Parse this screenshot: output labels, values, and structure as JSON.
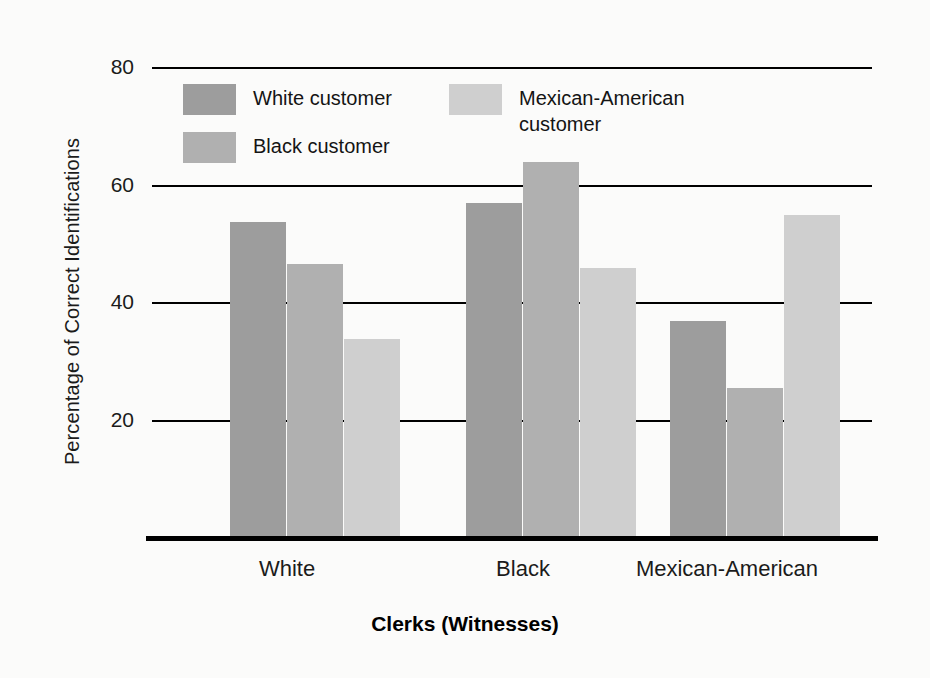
{
  "chart_data": {
    "type": "bar",
    "title": "",
    "subtitle": "",
    "xlabel": "Clerks (Witnesses)",
    "ylabel": "Percentage of Correct Identifications",
    "categories": [
      "White",
      "Black",
      "Mexican-American"
    ],
    "series": [
      {
        "name": "White customer",
        "values": [
          53.6,
          56.9,
          36.8
        ],
        "color": "#9d9d9d"
      },
      {
        "name": "Black customer",
        "values": [
          46.5,
          63.8,
          25.4
        ],
        "color": "#b0b0b0"
      },
      {
        "name": "Mexican-American\ncustomer",
        "values": [
          33.7,
          45.8,
          54.8
        ],
        "color": "#cfcfcf"
      }
    ],
    "ylim": [
      0,
      80
    ],
    "yticks": [
      20,
      40,
      60,
      80
    ],
    "ytick_labels": [
      "20",
      "40",
      "60",
      "80"
    ],
    "grid": true,
    "grid_axis": "y",
    "legend_position": "upper-left-inside",
    "annotations": []
  },
  "axes": {
    "y_title": "Percentage of Correct Identifications",
    "x_title": "Clerks (Witnesses)",
    "y_tick_labels": [
      "80",
      "60",
      "40",
      "20"
    ],
    "x_tick_labels": [
      "White",
      "Black",
      "Mexican-American"
    ]
  },
  "legend": {
    "entries": [
      {
        "label": "White customer"
      },
      {
        "label": "Black customer"
      },
      {
        "label": "Mexican-American\ncustomer"
      }
    ]
  },
  "colors": {
    "series_0": "#9d9d9d",
    "series_1": "#b0b0b0",
    "series_2": "#cfcfcf",
    "axis": "#000000",
    "text": "#1b1b1b",
    "background": "#fbfbfa"
  }
}
